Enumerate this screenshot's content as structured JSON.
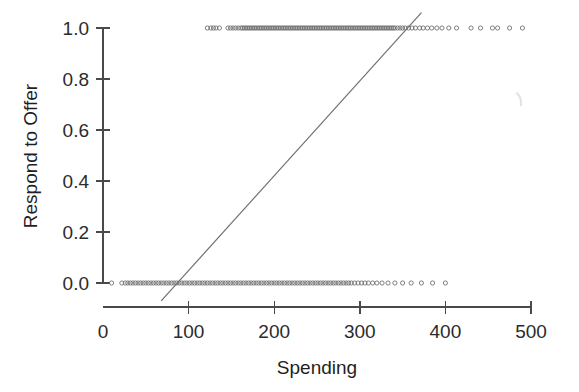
{
  "chart_data": {
    "type": "scatter",
    "title": "",
    "xlabel": "Spending",
    "ylabel": "Respond to Offer",
    "xlim": [
      0,
      510
    ],
    "ylim": [
      -0.04,
      1.06
    ],
    "grid": false,
    "legend": null,
    "x_ticks": [
      0,
      100,
      200,
      300,
      400,
      500
    ],
    "x_tick_labels": [
      "0",
      "100",
      "200",
      "300",
      "400",
      "500"
    ],
    "y_ticks": [
      0.0,
      0.2,
      0.4,
      0.6,
      0.8,
      1.0
    ],
    "y_tick_labels": [
      "0.0",
      "0.2",
      "0.4",
      "0.6",
      "0.8",
      "1.0"
    ],
    "marker": "open-circle",
    "marker_color": "#6b6b6b",
    "series": [
      {
        "name": "Respond = 1",
        "y_value": 1.0,
        "x_values": [
          122,
          126,
          129,
          132,
          136,
          146,
          149,
          152,
          155,
          158,
          161,
          163,
          165,
          167,
          169,
          171,
          173,
          175,
          177,
          179,
          181,
          183,
          185,
          187,
          189,
          191,
          193,
          195,
          197,
          199,
          201,
          203,
          205,
          207,
          209,
          211,
          213,
          215,
          217,
          219,
          221,
          223,
          225,
          227,
          229,
          231,
          233,
          235,
          237,
          239,
          241,
          243,
          245,
          247,
          249,
          251,
          253,
          255,
          257,
          259,
          261,
          263,
          265,
          267,
          269,
          271,
          273,
          275,
          277,
          279,
          281,
          283,
          285,
          287,
          289,
          291,
          293,
          295,
          297,
          299,
          301,
          303,
          305,
          307,
          309,
          311,
          313,
          315,
          317,
          319,
          321,
          323,
          325,
          327,
          329,
          331,
          333,
          335,
          337,
          339,
          341,
          344,
          347,
          350,
          353,
          357,
          361,
          365,
          370,
          374,
          379,
          384,
          390,
          396,
          404,
          413,
          430,
          441,
          455,
          461,
          475,
          490
        ]
      },
      {
        "name": "Respond = 0",
        "y_value": 0.0,
        "x_values": [
          10,
          22,
          26,
          29,
          32,
          35,
          38,
          41,
          44,
          47,
          50,
          53,
          56,
          59,
          62,
          65,
          68,
          71,
          74,
          77,
          80,
          83,
          86,
          89,
          92,
          95,
          98,
          101,
          104,
          107,
          110,
          113,
          116,
          119,
          122,
          125,
          128,
          131,
          134,
          137,
          140,
          143,
          146,
          149,
          152,
          155,
          158,
          161,
          164,
          167,
          170,
          173,
          176,
          179,
          182,
          185,
          188,
          191,
          194,
          197,
          200,
          203,
          206,
          209,
          212,
          215,
          218,
          221,
          224,
          227,
          230,
          233,
          236,
          239,
          242,
          245,
          248,
          251,
          254,
          257,
          260,
          263,
          266,
          269,
          272,
          275,
          278,
          281,
          284,
          287,
          290,
          294,
          298,
          302,
          306,
          310,
          315,
          320,
          326,
          333,
          341,
          350,
          360,
          372,
          385,
          400
        ]
      }
    ],
    "fit_line": {
      "name": "linear-fit",
      "color": "#707070",
      "x_start": 68,
      "y_start": -0.07,
      "x_end": 372,
      "y_end": 1.06
    },
    "artifact": {
      "name": "scan-smudge",
      "x": 487,
      "y": 0.72,
      "color": "#e3e3e3"
    }
  }
}
